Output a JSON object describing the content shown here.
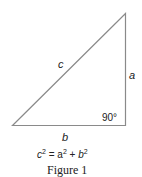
{
  "figure": {
    "labels": {
      "hypotenuse": "c",
      "vertical_leg": "a",
      "horizontal_leg": "b",
      "right_angle": "90°"
    },
    "equation": {
      "lhs_base": "c",
      "lhs_exp": "2",
      "equals": " = ",
      "a_base": "a",
      "a_exp": "2",
      "plus": " + ",
      "b_base": "b",
      "b_exp": "2"
    },
    "caption": "Figure 1",
    "colors": {
      "stroke": "#888888",
      "text": "#222222"
    }
  }
}
